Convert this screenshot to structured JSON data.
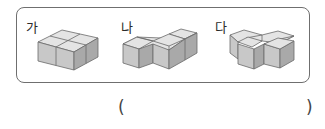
{
  "problem": {
    "figures": [
      {
        "label": "가",
        "shape": "cube-stack-2x2"
      },
      {
        "label": "나",
        "shape": "cube-stack-zigzag"
      },
      {
        "label": "다",
        "shape": "cube-stack-t"
      }
    ],
    "answer": {
      "open_paren": "(",
      "close_paren": ")",
      "value": ""
    }
  },
  "colors": {
    "top_face": "#e4e4e4",
    "front_face": "#c8c8c8",
    "side_face": "#a9a9a9",
    "edge": "#6a6a6a",
    "border": "#6f6f6f"
  }
}
